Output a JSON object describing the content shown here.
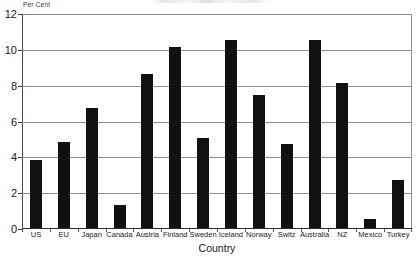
{
  "chart_data": {
    "type": "bar",
    "title": "",
    "xlabel": "Country",
    "ylabel": "Per Cent",
    "ylim": [
      0,
      12
    ],
    "yticks": [
      0,
      2,
      4,
      6,
      8,
      10,
      12
    ],
    "grid": true,
    "legend": "none",
    "bar_color": "#111111",
    "categories": [
      "US",
      "EU",
      "Japan",
      "Canada",
      "Austria",
      "Finland",
      "Sweden",
      "Iceland",
      "Norway",
      "Switz",
      "Australia",
      "NZ",
      "Mexico",
      "Turkey"
    ],
    "values": [
      3.8,
      4.8,
      6.7,
      1.3,
      8.6,
      10.1,
      5.0,
      10.5,
      7.4,
      4.7,
      10.5,
      8.1,
      0.5,
      2.7
    ]
  }
}
